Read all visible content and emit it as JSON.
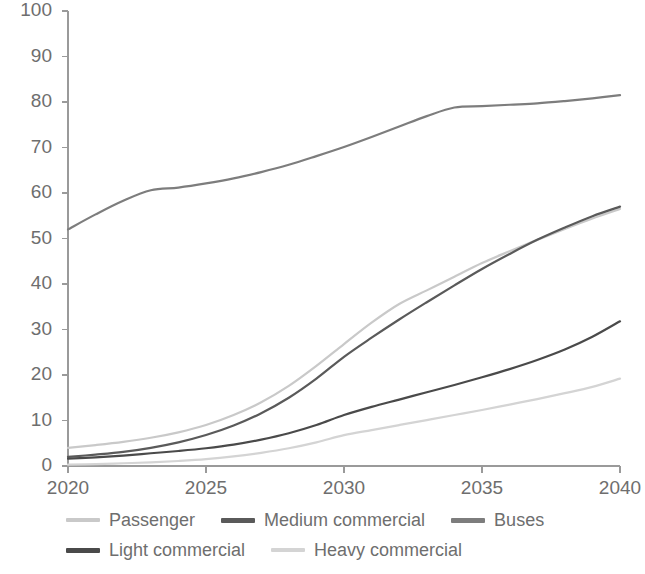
{
  "chart_data": {
    "type": "line",
    "title": "",
    "subtitle": "",
    "xlabel": "",
    "ylabel": "",
    "xlim": [
      2020,
      2040
    ],
    "ylim": [
      0,
      100
    ],
    "ytick_labels": [
      "0",
      "10",
      "20",
      "30",
      "40",
      "50",
      "60",
      "70",
      "80",
      "90",
      "100"
    ],
    "ytick_values": [
      0,
      10,
      20,
      30,
      40,
      50,
      60,
      70,
      80,
      90,
      100
    ],
    "xtick_labels": [
      "2020",
      "2025",
      "2030",
      "2035",
      "2040"
    ],
    "xtick_values": [
      2020,
      2025,
      2030,
      2035,
      2040
    ],
    "grid": false,
    "legend_position": "bottom",
    "x": [
      2020,
      2021,
      2022,
      2023,
      2024,
      2025,
      2026,
      2027,
      2028,
      2029,
      2030,
      2031,
      2032,
      2033,
      2034,
      2035,
      2036,
      2037,
      2038,
      2039,
      2040
    ],
    "series": [
      {
        "name": "Passenger",
        "color": "#c9c9c9",
        "values": [
          4.0,
          4.6,
          5.3,
          6.2,
          7.4,
          9.0,
          11.2,
          14.0,
          17.6,
          22.0,
          26.8,
          31.5,
          35.6,
          38.6,
          41.6,
          44.6,
          47.2,
          49.7,
          52.1,
          54.4,
          56.5
        ]
      },
      {
        "name": "Medium commercial",
        "color": "#5a5a5a",
        "values": [
          2.0,
          2.5,
          3.1,
          4.0,
          5.2,
          6.8,
          8.9,
          11.6,
          15.0,
          19.2,
          24.0,
          28.2,
          32.2,
          36.0,
          39.7,
          43.3,
          46.6,
          49.7,
          52.4,
          54.9,
          57.0
        ]
      },
      {
        "name": "Buses",
        "color": "#7d7d7d",
        "values": [
          52.0,
          55.3,
          58.3,
          60.6,
          61.2,
          62.1,
          63.2,
          64.6,
          66.2,
          68.1,
          70.1,
          72.3,
          74.6,
          76.9,
          78.8,
          79.1,
          79.4,
          79.7,
          80.2,
          80.8,
          81.5
        ]
      },
      {
        "name": "Light commercial",
        "color": "#4a4a4a",
        "values": [
          1.6,
          1.9,
          2.3,
          2.8,
          3.3,
          3.9,
          4.7,
          5.8,
          7.2,
          9.0,
          11.2,
          13.0,
          14.6,
          16.2,
          17.8,
          19.5,
          21.3,
          23.3,
          25.6,
          28.4,
          31.8
        ]
      },
      {
        "name": "Heavy commercial",
        "color": "#d4d4d4",
        "values": [
          0.3,
          0.4,
          0.6,
          0.8,
          1.1,
          1.5,
          2.1,
          2.9,
          3.9,
          5.2,
          6.8,
          7.9,
          9.0,
          10.1,
          11.2,
          12.3,
          13.5,
          14.7,
          16.0,
          17.4,
          19.2
        ]
      }
    ]
  },
  "legend": {
    "rows": [
      [
        {
          "label": "Passenger",
          "color": "#c9c9c9",
          "thickness": 4
        },
        {
          "label": "Medium commercial",
          "color": "#5a5a5a",
          "thickness": 5
        },
        {
          "label": "Buses",
          "color": "#7d7d7d",
          "thickness": 5
        }
      ],
      [
        {
          "label": "Light commercial",
          "color": "#4a4a4a",
          "thickness": 5
        },
        {
          "label": "Heavy commercial",
          "color": "#d4d4d4",
          "thickness": 4
        }
      ]
    ]
  },
  "axis_style": {
    "axis_color": "#9a9a9a",
    "tick_color": "#9a9a9a",
    "text_color": "#6e6e6e"
  }
}
